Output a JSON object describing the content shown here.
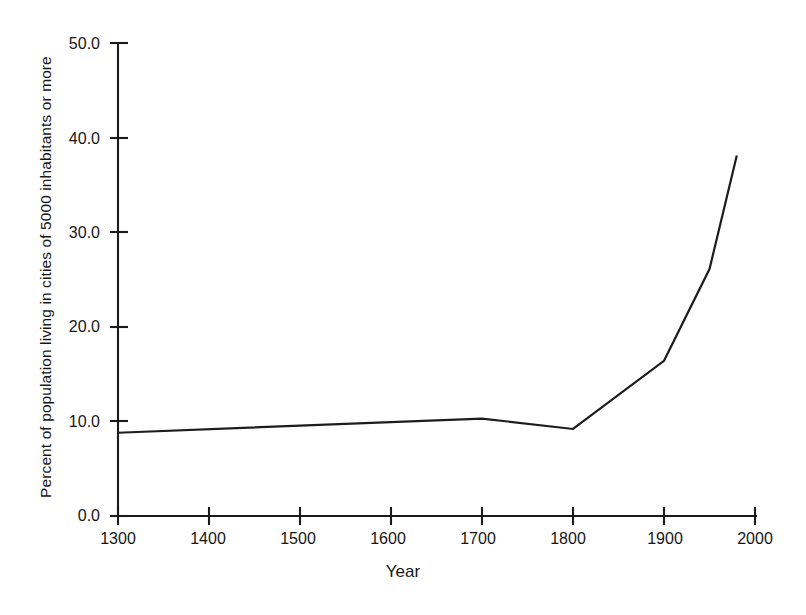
{
  "chart_data": {
    "type": "line",
    "title": "",
    "subtitle": "",
    "xlabel": "Year",
    "ylabel": "Percent of population living in cities of 5000 inhabitants or more",
    "xlim": [
      1300,
      2000
    ],
    "ylim": [
      0.0,
      50.0
    ],
    "grid": false,
    "legend": "none",
    "xticks": [
      1300,
      1400,
      1500,
      1600,
      1700,
      1800,
      1900,
      2000
    ],
    "xtick_labels": [
      "1300",
      "1400",
      "1500",
      "1600",
      "1700",
      "1800",
      "1900",
      "2000"
    ],
    "yticks": [
      0.0,
      10.0,
      20.0,
      30.0,
      40.0,
      50.0
    ],
    "ytick_labels": [
      "0.0",
      "10.0",
      "20.0",
      "30.0",
      "40.0",
      "50.0"
    ],
    "line_color": "#1c1c1c",
    "series": [
      {
        "name": "Urbanization",
        "x": [
          1300,
          1700,
          1800,
          1900,
          1950,
          1980
        ],
        "values": [
          8.8,
          10.3,
          9.2,
          16.4,
          26.1,
          38.1
        ]
      }
    ]
  },
  "axis": {
    "y_title": "Percent of population living in cities of 5000 inhabitants or more",
    "x_title": "Year"
  }
}
